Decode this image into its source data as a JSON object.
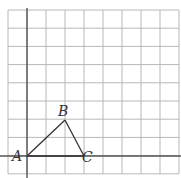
{
  "diagram": {
    "type": "grid-triangle",
    "grid": {
      "columns": 9,
      "rows": 9,
      "line_color": "#b8b8b8",
      "axis_color": "#555555"
    },
    "points": [
      {
        "label": "A",
        "grid_x": 0,
        "grid_y": 0
      },
      {
        "label": "B",
        "grid_x": 2,
        "grid_y": 2
      },
      {
        "label": "C",
        "grid_x": 3,
        "grid_y": 0
      }
    ],
    "segments": [
      [
        "A",
        "B"
      ],
      [
        "B",
        "C"
      ],
      [
        "A",
        "C"
      ]
    ]
  }
}
